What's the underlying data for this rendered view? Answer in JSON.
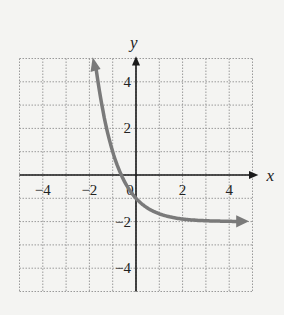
{
  "chart_data": {
    "type": "line",
    "title": "",
    "xlabel": "x",
    "ylabel": "y",
    "xlim": [
      -5,
      5
    ],
    "ylim": [
      -5,
      5
    ],
    "grid": true,
    "x_ticks": [
      "-4",
      "-2",
      "0",
      "2",
      "4"
    ],
    "y_ticks": [
      "4",
      "2",
      "-2",
      "-4"
    ],
    "function": "y = 3^(-x) - 2",
    "series": [
      {
        "name": "curve",
        "x": [
          -1.77,
          -1.5,
          -1.0,
          -0.63,
          -0.5,
          0,
          0.5,
          1,
          2,
          3,
          4,
          4.7
        ],
        "y": [
          5.0,
          3.2,
          1.0,
          0.0,
          -0.27,
          -1.0,
          -1.42,
          -1.67,
          -1.89,
          -1.96,
          -1.99,
          -2.0
        ]
      }
    ],
    "asymptote": -2,
    "colors": {
      "curve": "#7a7a7a",
      "axes": "#1a1a1a",
      "grid": "#9a9a9a"
    }
  }
}
